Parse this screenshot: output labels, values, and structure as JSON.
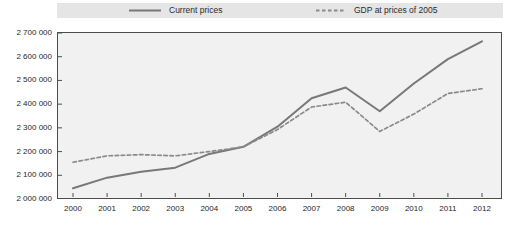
{
  "legend": {
    "items": [
      {
        "label": "Current prices",
        "style": "solid"
      },
      {
        "label": "GDP at prices of 2005",
        "style": "dashed"
      }
    ]
  },
  "chart_data": {
    "type": "line",
    "title": "",
    "xlabel": "",
    "ylabel": "",
    "x": [
      2000,
      2001,
      2002,
      2003,
      2004,
      2005,
      2006,
      2007,
      2008,
      2009,
      2010,
      2011,
      2012
    ],
    "x_tick_labels": [
      "2000",
      "2001",
      "2002",
      "2003",
      "2004",
      "2005",
      "2006",
      "2007",
      "2008",
      "2009",
      "2010",
      "2011",
      "2012"
    ],
    "series": [
      {
        "name": "Current prices",
        "style": "solid",
        "color": "#787878",
        "values": [
          2045000,
          2090000,
          2115000,
          2132000,
          2190000,
          2220000,
          2305000,
          2425000,
          2470000,
          2370000,
          2487000,
          2590000,
          2665000
        ]
      },
      {
        "name": "GDP at prices of 2005",
        "style": "dashed",
        "color": "#8a8a8a",
        "values": [
          2155000,
          2182000,
          2187000,
          2182000,
          2200000,
          2220000,
          2293000,
          2388000,
          2408000,
          2285000,
          2358000,
          2445000,
          2465000
        ]
      }
    ],
    "ylim": [
      2000000,
      2700000
    ],
    "ytick_step": 100000,
    "y_tick_labels": [
      "2 700 000",
      "2 600 000",
      "2 500 000",
      "2 400 000",
      "2 300 000",
      "2 200 000",
      "2 100 000",
      "2 000 000"
    ],
    "grid": false,
    "legend_position": "top",
    "colors": {
      "axis": "#4d4d4d",
      "plot_background": "#f1f1f1",
      "legend_background": "#e5e5e5",
      "text": "#262626"
    }
  },
  "geometry_note": "y-axis ticks every 100 000 from 2 000 000 to 2 700 000; x ticks at each year"
}
